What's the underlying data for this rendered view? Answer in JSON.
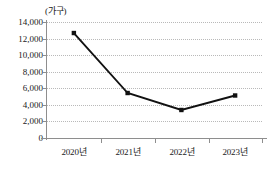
{
  "chart_data": {
    "type": "line",
    "title": "",
    "subtitle": "",
    "xlabel": "",
    "ylabel": "",
    "unit_label": "(가구)",
    "categories": [
      "2020년",
      "2021년",
      "2022년",
      "2023년"
    ],
    "values": [
      12670,
      5430,
      3380,
      5130
    ],
    "series": [
      {
        "name": "",
        "values": [
          12670,
          5430,
          3380,
          5130
        ]
      }
    ],
    "ylim": [
      0,
      14000
    ],
    "y_ticks": [
      0,
      2000,
      4000,
      6000,
      8000,
      10000,
      12000,
      14000
    ],
    "y_tick_labels": [
      "0",
      "2,000",
      "4,000",
      "6,000",
      "8,000",
      "10,000",
      "12,000",
      "14,000"
    ],
    "grid": "horizontal-dotted",
    "legend": "none",
    "marker": "square",
    "line_color": "#111111",
    "grid_color": "#b9b9b9",
    "axis_color": "#8e8e8e",
    "background_color": "#ffffff"
  }
}
